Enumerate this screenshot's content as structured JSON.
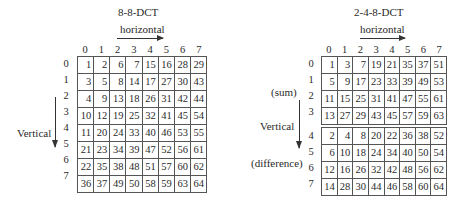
{
  "left": {
    "title": "8-8-DCT",
    "horizontal_label": "horizontal",
    "vertical_label": "Vertical",
    "col_indices": [
      "0",
      "1",
      "2",
      "3",
      "4",
      "5",
      "6",
      "7"
    ],
    "row_indices": [
      "0",
      "1",
      "2",
      "3",
      "4",
      "5",
      "6",
      "7"
    ],
    "rows": [
      [
        "1",
        "2",
        "6",
        "7",
        "15",
        "16",
        "28",
        "29"
      ],
      [
        "3",
        "5",
        "8",
        "14",
        "17",
        "27",
        "30",
        "43"
      ],
      [
        "4",
        "9",
        "13",
        "18",
        "26",
        "31",
        "42",
        "44"
      ],
      [
        "10",
        "12",
        "19",
        "25",
        "32",
        "41",
        "45",
        "54"
      ],
      [
        "11",
        "20",
        "24",
        "33",
        "40",
        "46",
        "53",
        "55"
      ],
      [
        "21",
        "23",
        "34",
        "39",
        "47",
        "52",
        "56",
        "61"
      ],
      [
        "22",
        "35",
        "38",
        "48",
        "51",
        "57",
        "60",
        "62"
      ],
      [
        "36",
        "37",
        "49",
        "50",
        "58",
        "59",
        "63",
        "64"
      ]
    ]
  },
  "right": {
    "title": "2-4-8-DCT",
    "horizontal_label": "horizontal",
    "vertical_label": "Vertical",
    "sum_label": "(sum)",
    "difference_label": "(difference)",
    "col_indices": [
      "0",
      "1",
      "2",
      "3",
      "4",
      "5",
      "6",
      "7"
    ],
    "sum_row_indices": [
      "0",
      "1",
      "2",
      "3"
    ],
    "diff_row_indices": [
      "4",
      "5",
      "6",
      "7"
    ],
    "sum_rows": [
      [
        "1",
        "3",
        "7",
        "19",
        "21",
        "35",
        "37",
        "51"
      ],
      [
        "5",
        "9",
        "17",
        "23",
        "33",
        "39",
        "49",
        "53"
      ],
      [
        "11",
        "15",
        "25",
        "31",
        "41",
        "47",
        "55",
        "61"
      ],
      [
        "13",
        "27",
        "29",
        "43",
        "45",
        "57",
        "59",
        "63"
      ]
    ],
    "diff_rows": [
      [
        "2",
        "4",
        "8",
        "20",
        "22",
        "36",
        "38",
        "52"
      ],
      [
        "6",
        "10",
        "18",
        "24",
        "34",
        "40",
        "50",
        "54"
      ],
      [
        "12",
        "16",
        "26",
        "32",
        "42",
        "48",
        "56",
        "62"
      ],
      [
        "14",
        "28",
        "30",
        "44",
        "46",
        "58",
        "60",
        "64"
      ]
    ]
  }
}
